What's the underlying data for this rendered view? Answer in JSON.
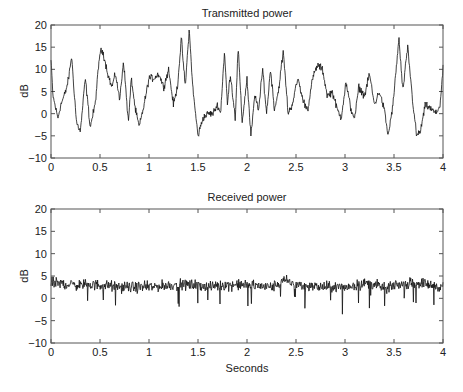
{
  "chart_data": [
    {
      "type": "line",
      "title": "Transmitted power",
      "xlabel": "",
      "ylabel": "dB",
      "xlim": [
        0,
        4
      ],
      "ylim": [
        -10,
        20
      ],
      "xticks": [
        0,
        0.5,
        1,
        1.5,
        2,
        2.5,
        3,
        3.5,
        4
      ],
      "xtick_labels": [
        "0",
        "0.5",
        "1",
        "1.5",
        "2",
        "2.5",
        "3",
        "3.5",
        "4"
      ],
      "yticks": [
        -10,
        -5,
        0,
        5,
        10,
        15,
        20
      ],
      "ytick_labels": [
        "−10",
        "−5",
        "0",
        "5",
        "10",
        "15",
        "20"
      ],
      "grid": false,
      "noise_amplitude_db": 1.2,
      "series": [
        {
          "name": "Transmitted power",
          "x": [
            0,
            0.02,
            0.07,
            0.1,
            0.15,
            0.18,
            0.21,
            0.26,
            0.3,
            0.35,
            0.4,
            0.45,
            0.5,
            0.53,
            0.58,
            0.62,
            0.66,
            0.7,
            0.74,
            0.79,
            0.82,
            0.86,
            0.9,
            0.95,
            1.0,
            1.05,
            1.1,
            1.15,
            1.2,
            1.25,
            1.29,
            1.33,
            1.37,
            1.41,
            1.45,
            1.5,
            1.55,
            1.6,
            1.65,
            1.7,
            1.73,
            1.77,
            1.8,
            1.83,
            1.88,
            1.91,
            1.95,
            2.0,
            2.04,
            2.08,
            2.12,
            2.16,
            2.2,
            2.24,
            2.28,
            2.32,
            2.37,
            2.42,
            2.46,
            2.52,
            2.57,
            2.62,
            2.67,
            2.72,
            2.77,
            2.82,
            2.87,
            2.92,
            2.96,
            3.01,
            3.06,
            3.1,
            3.14,
            3.2,
            3.25,
            3.3,
            3.35,
            3.4,
            3.44,
            3.49,
            3.55,
            3.59,
            3.64,
            3.69,
            3.73,
            3.77,
            3.82,
            3.88,
            3.93,
            3.97,
            4.0
          ],
          "y": [
            12,
            4,
            -1,
            2,
            5,
            8,
            13,
            -2,
            -4,
            8,
            -3,
            2,
            14,
            14,
            9,
            6,
            9,
            3,
            12,
            -2,
            8,
            1,
            -3,
            2,
            8,
            8,
            9,
            6,
            10,
            2,
            6,
            17,
            6,
            19,
            5,
            -5,
            -1,
            0,
            0,
            2,
            0,
            14,
            2,
            9,
            -1,
            15,
            -2,
            8,
            -5,
            4,
            1,
            10,
            0,
            10,
            1,
            5,
            14,
            0,
            2,
            8,
            3,
            1,
            8,
            11,
            10,
            4,
            5,
            1,
            -1,
            7,
            1,
            -1,
            6,
            4,
            9,
            2,
            5,
            1,
            -5,
            2,
            17,
            5,
            15,
            3,
            -5,
            -4,
            2,
            1,
            0,
            2,
            10
          ]
        }
      ]
    },
    {
      "type": "line",
      "title": "Received power",
      "xlabel": "Seconds",
      "ylabel": "dB",
      "xlim": [
        0,
        4
      ],
      "ylim": [
        -10,
        20
      ],
      "xticks": [
        0,
        0.5,
        1,
        1.5,
        2,
        2.5,
        3,
        3.5,
        4
      ],
      "xtick_labels": [
        "0",
        "0.5",
        "1",
        "1.5",
        "2",
        "2.5",
        "3",
        "3.5",
        "4"
      ],
      "yticks": [
        -10,
        -5,
        0,
        5,
        10,
        15,
        20
      ],
      "ytick_labels": [
        "−10",
        "−5",
        "0",
        "5",
        "10",
        "15",
        "20"
      ],
      "grid": false,
      "mean_db": 3,
      "noise_amplitude_db": 1.8,
      "series": [
        {
          "name": "Received power",
          "x": [
            0,
            0.25,
            0.5,
            0.73,
            1.0,
            1.25,
            1.5,
            1.6,
            1.75,
            2.0,
            2.25,
            2.4,
            2.5,
            2.75,
            3.0,
            3.25,
            3.43,
            3.5,
            3.75,
            4.0
          ],
          "y": [
            3.5,
            3,
            3,
            2.5,
            2.5,
            3,
            3,
            2.5,
            3,
            3,
            2.5,
            4,
            3,
            2.5,
            2.5,
            3.5,
            2,
            3,
            3.5,
            2.5
          ]
        }
      ]
    }
  ]
}
